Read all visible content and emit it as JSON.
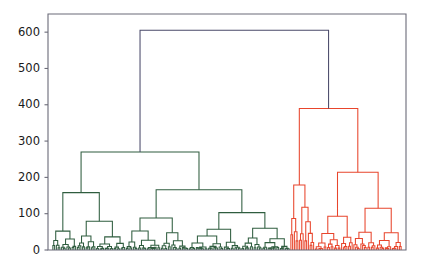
{
  "figure": {
    "title": "",
    "background": "#ffffff",
    "width": 423,
    "height": 271
  },
  "chart_data": {
    "type": "dendrogram",
    "title": "",
    "xlabel": "",
    "ylabel": "",
    "ylim": [
      0,
      650
    ],
    "xlim": [
      0,
      200
    ],
    "grid": false,
    "legend": false,
    "yticks": [
      0,
      100,
      200,
      300,
      400,
      500,
      600
    ],
    "ytick_labels": [
      "0",
      "100",
      "200",
      "300",
      "400",
      "500",
      "600"
    ],
    "xticks": [],
    "xtick_labels": [],
    "orientation": "top",
    "n_leaves": 200,
    "color_threshold": 420,
    "link_colors": {
      "root": "#4a4a6a",
      "cluster_green": "#2f5d3f",
      "cluster_red": "#e8452c"
    },
    "axes_color": "#6b6b78",
    "root_height": 605,
    "clusters": [
      {
        "name": "green",
        "color": "#2f5d3f",
        "leaf_start": 0,
        "leaf_end": 136,
        "root_height": 270
      },
      {
        "name": "red",
        "color": "#e8452c",
        "leaf_start": 136,
        "leaf_end": 200,
        "root_height": 390
      }
    ],
    "major_merges": [
      {
        "id": "root",
        "height": 605,
        "color": "#4a4a6a",
        "left": "green_root",
        "right": "red_root"
      },
      {
        "id": "green_root",
        "height": 270,
        "color": "#2f5d3f",
        "left": "g_A",
        "right": "g_B"
      },
      {
        "id": "g_A",
        "height": 158,
        "color": "#2f5d3f",
        "left": "g_A1",
        "right": "g_A2"
      },
      {
        "id": "g_B",
        "height": 166,
        "color": "#2f5d3f",
        "left": "g_B1",
        "right": "g_B2"
      },
      {
        "id": "g_A1",
        "height": 52,
        "color": "#2f5d3f"
      },
      {
        "id": "g_A2",
        "height": 79,
        "color": "#2f5d3f"
      },
      {
        "id": "g_B1",
        "height": 88,
        "color": "#2f5d3f"
      },
      {
        "id": "g_B2",
        "height": 103,
        "color": "#2f5d3f"
      },
      {
        "id": "red_root",
        "height": 390,
        "color": "#e8452c",
        "left": "r_A",
        "right": "r_B"
      },
      {
        "id": "r_A",
        "height": 179,
        "color": "#e8452c"
      },
      {
        "id": "r_B",
        "height": 214,
        "color": "#e8452c",
        "left": "r_B1",
        "right": "r_B2"
      },
      {
        "id": "r_B1",
        "height": 93,
        "color": "#e8452c"
      },
      {
        "id": "r_B2",
        "height": 115,
        "color": "#e8452c"
      }
    ]
  },
  "axes": {
    "plot_left": 48,
    "plot_right": 406,
    "plot_top": 14,
    "plot_bottom": 250
  }
}
